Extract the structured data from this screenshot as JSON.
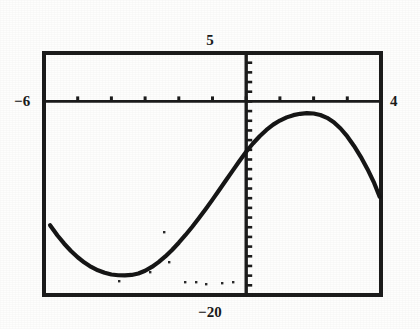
{
  "window": {
    "ymax_label": "5",
    "ymin_label": "−20",
    "xmin_label": "−6",
    "xmax_label": "4"
  },
  "chart_data": {
    "type": "line",
    "title": "",
    "xlabel": "",
    "ylabel": "",
    "xlim": [
      -6,
      4
    ],
    "ylim": [
      -20,
      5
    ],
    "grid": false,
    "legend": null,
    "axis": {
      "x_axis_at_y": 0,
      "y_axis_at_x": 0,
      "x_tick_interval": 1,
      "y_tick_interval": 1,
      "x_ticks": [
        -6,
        -5,
        -4,
        -3,
        -2,
        -1,
        0,
        1,
        2,
        3,
        4
      ],
      "y_ticks": [
        5,
        4,
        3,
        2,
        1,
        0,
        -1,
        -2,
        -3,
        -4,
        -5,
        -6,
        -7,
        -8,
        -9,
        -10,
        -11,
        -12,
        -13,
        -14,
        -15,
        -16,
        -17,
        -18,
        -19,
        -20
      ]
    },
    "series": [
      {
        "name": "curve",
        "x": [
          -5.82,
          -5.6,
          -5.4,
          -5.2,
          -5.0,
          -4.8,
          -4.6,
          -4.4,
          -4.2,
          -4.0,
          -3.8,
          -3.6,
          -3.4,
          -3.2,
          -3.0,
          -2.8,
          -2.6,
          -2.4,
          -2.2,
          -2.0,
          -1.8,
          -1.6,
          -1.4,
          -1.2,
          -1.0,
          -0.8,
          -0.6,
          -0.4,
          -0.2,
          0.0,
          0.2,
          0.4,
          0.6,
          0.8,
          1.0,
          1.2,
          1.4,
          1.6,
          1.8,
          2.0,
          2.2,
          2.4,
          2.6,
          2.8,
          3.0,
          3.2,
          3.4,
          3.6,
          3.8,
          3.96
        ],
        "y": [
          -12.8,
          -13.85,
          -14.7,
          -15.45,
          -16.1,
          -16.65,
          -17.1,
          -17.45,
          -17.7,
          -17.88,
          -17.96,
          -17.98,
          -17.93,
          -17.78,
          -17.5,
          -17.1,
          -16.6,
          -16.02,
          -15.35,
          -14.6,
          -13.8,
          -12.95,
          -12.05,
          -11.12,
          -10.15,
          -9.15,
          -8.15,
          -7.15,
          -6.15,
          -5.2,
          -4.35,
          -3.6,
          -2.95,
          -2.4,
          -1.98,
          -1.65,
          -1.42,
          -1.28,
          -1.22,
          -1.25,
          -1.4,
          -1.7,
          -2.15,
          -2.8,
          -3.62,
          -4.6,
          -5.72,
          -7.0,
          -8.45,
          -9.85
        ]
      }
    ],
    "notable_points": {
      "local_minimum": {
        "x": -3.7,
        "y": -18.0
      },
      "local_maximum": {
        "x": 1.8,
        "y": -1.2
      },
      "y_intercept": {
        "x": 0,
        "y": -5.2
      }
    },
    "speckles": [
      {
        "x": 164,
        "y": 232
      },
      {
        "x": 169,
        "y": 262
      },
      {
        "x": 150,
        "y": 272
      },
      {
        "x": 119,
        "y": 281
      },
      {
        "x": 185,
        "y": 282
      },
      {
        "x": 196,
        "y": 282
      },
      {
        "x": 206,
        "y": 284
      },
      {
        "x": 222,
        "y": 283
      },
      {
        "x": 233,
        "y": 282
      }
    ]
  }
}
